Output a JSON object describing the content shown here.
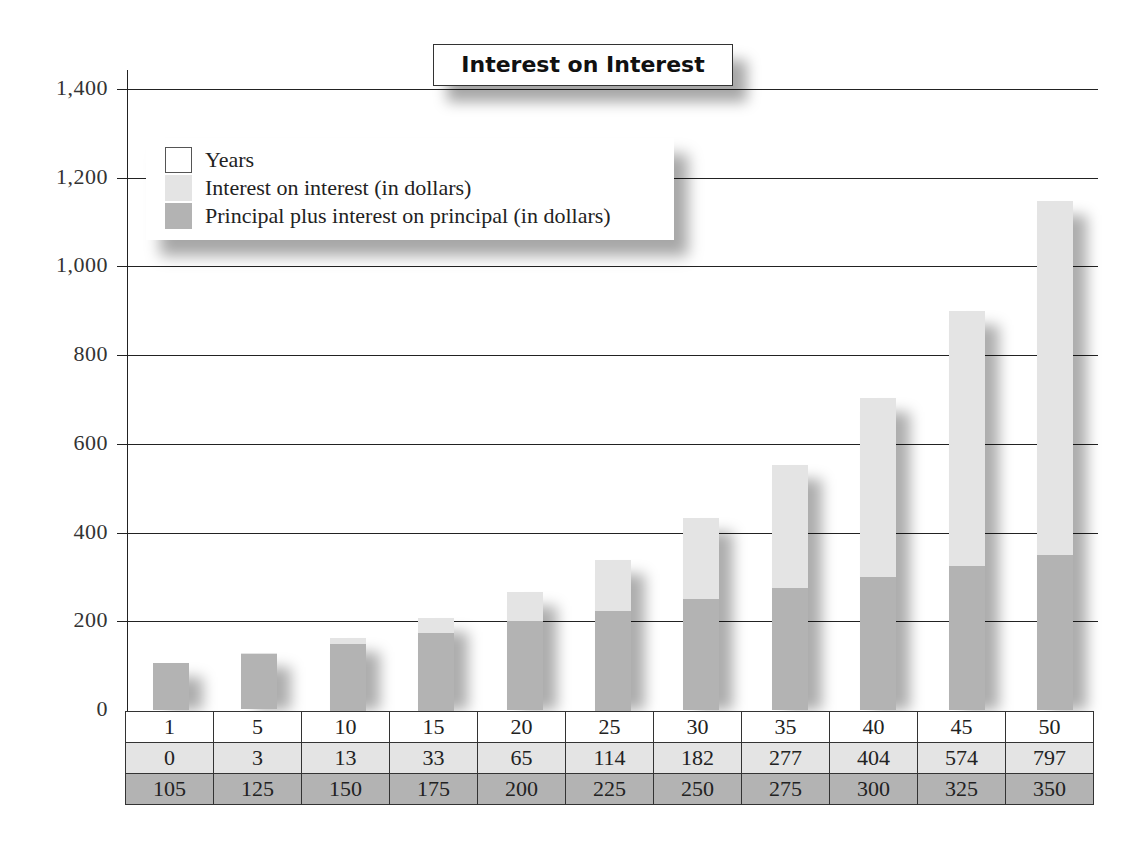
{
  "chart_data": {
    "type": "bar",
    "stacked": true,
    "title": "Interest on Interest",
    "xlabel": "Years",
    "ylabel": "",
    "ylim": [
      0,
      1400
    ],
    "yticks": [
      0,
      200,
      400,
      600,
      800,
      1000,
      1200,
      1400
    ],
    "ytick_labels": [
      "0",
      "200",
      "400",
      "600",
      "800",
      "1,000",
      "1,200",
      "1,400"
    ],
    "grid": true,
    "legend_position": "upper-left",
    "categories": [
      "1",
      "5",
      "10",
      "15",
      "20",
      "25",
      "30",
      "35",
      "40",
      "45",
      "50"
    ],
    "series": [
      {
        "name": "Principal plus interest on principal (in dollars)",
        "color": "#b3b3b3",
        "values": [
          105,
          125,
          150,
          175,
          200,
          225,
          250,
          275,
          300,
          325,
          350
        ]
      },
      {
        "name": "Interest on interest (in dollars)",
        "color": "#e4e4e4",
        "values": [
          0,
          3,
          13,
          33,
          65,
          114,
          182,
          277,
          404,
          574,
          797
        ]
      }
    ]
  },
  "legend": {
    "items": [
      {
        "label": "Years",
        "color": "#ffffff",
        "border": true
      },
      {
        "label": "Interest on interest (in dollars)",
        "color": "#e4e4e4",
        "border": false
      },
      {
        "label": "Principal plus interest on principal (in dollars)",
        "color": "#b3b3b3",
        "border": false
      }
    ]
  },
  "table": {
    "rows": [
      {
        "key": "years",
        "cells": [
          "1",
          "5",
          "10",
          "15",
          "20",
          "25",
          "30",
          "35",
          "40",
          "45",
          "50"
        ]
      },
      {
        "key": "ii",
        "cells": [
          "0",
          "3",
          "13",
          "33",
          "65",
          "114",
          "182",
          "277",
          "404",
          "574",
          "797"
        ]
      },
      {
        "key": "pp",
        "cells": [
          "105",
          "125",
          "150",
          "175",
          "200",
          "225",
          "250",
          "275",
          "300",
          "325",
          "350"
        ]
      }
    ]
  }
}
